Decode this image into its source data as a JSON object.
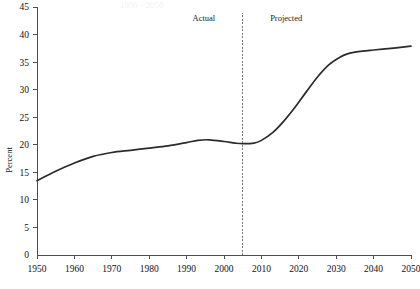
{
  "title_faint": "1950 - 2050",
  "colors": {
    "line": "#2b2b2b",
    "axis": "#4d4d4d",
    "divider": "#7a7a7a",
    "text": "#111111",
    "background": "#ffffff"
  },
  "annotations": {
    "actual_label": "Actual",
    "projected_label": "Projected",
    "divider_year": 2005
  },
  "chart_data": {
    "type": "line",
    "title": "",
    "xlabel": "",
    "ylabel": "Percent",
    "xlim": [
      1950,
      2050
    ],
    "ylim": [
      0,
      45
    ],
    "xticks": [
      1950,
      1960,
      1970,
      1980,
      1990,
      2000,
      2010,
      2020,
      2030,
      2040,
      2050
    ],
    "yticks": [
      0,
      5,
      10,
      15,
      20,
      25,
      30,
      35,
      40,
      45
    ],
    "xtick_labels": [
      "1950",
      "1960",
      "1970",
      "1980",
      "1990",
      "2000",
      "2010",
      "2020",
      "2030",
      "2040",
      "2050"
    ],
    "ytick_labels": [
      "0",
      "5",
      "10",
      "15",
      "20",
      "25",
      "30",
      "35",
      "40",
      "45"
    ],
    "grid": false,
    "legend": false,
    "series": [
      {
        "name": "Percent",
        "x": [
          1950,
          1955,
          1960,
          1965,
          1970,
          1975,
          1980,
          1985,
          1990,
          1993,
          1996,
          2000,
          2003,
          2005,
          2008,
          2010,
          2013,
          2016,
          2019,
          2022,
          2025,
          2028,
          2031,
          2033,
          2035,
          2037,
          2040,
          2043,
          2046,
          2050
        ],
        "values": [
          13.5,
          15.2,
          16.7,
          17.9,
          18.6,
          19.0,
          19.4,
          19.8,
          20.4,
          20.8,
          20.9,
          20.6,
          20.3,
          20.2,
          20.3,
          20.8,
          22.2,
          24.3,
          26.8,
          29.6,
          32.3,
          34.5,
          35.9,
          36.5,
          36.8,
          37.0,
          37.2,
          37.4,
          37.6,
          37.9
        ]
      }
    ],
    "annotations": [
      {
        "text": "Actual",
        "x": 1999,
        "y": 42.5
      },
      {
        "text": "Projected",
        "x": 2011,
        "y": 42.5
      }
    ],
    "vertical_divider": {
      "x": 2005,
      "style": "dotted"
    }
  }
}
